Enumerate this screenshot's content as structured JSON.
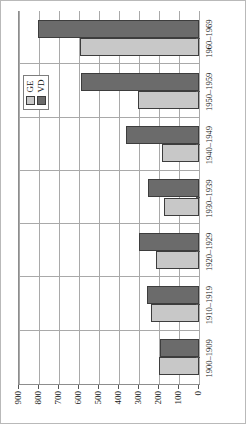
{
  "chart_data": {
    "type": "bar",
    "orientation": "horizontal",
    "title": "",
    "subtitle": "",
    "xlabel": "",
    "ylabel": "",
    "grid": true,
    "legend_position": "top-right-inside",
    "categories": [
      "1900–1909",
      "1910–1919",
      "1920–1929",
      "1930–1939",
      "1940–1949",
      "1950–1959",
      "1960–1969"
    ],
    "value_axis": {
      "min": 0,
      "max": 900,
      "ticks": [
        0,
        100,
        200,
        300,
        400,
        500,
        600,
        700,
        800,
        900
      ],
      "tick_labels": [
        "0",
        "100",
        "200",
        "300",
        "400",
        "500",
        "600",
        "700",
        "800",
        "900"
      ],
      "direction": "right-to-left"
    },
    "ylim": [
      0,
      900
    ],
    "series": [
      {
        "name": "GE",
        "color": "#c8c8c8",
        "values": [
          200,
          240,
          215,
          175,
          185,
          305,
          595
        ]
      },
      {
        "name": "VD",
        "color": "#6b6b6b",
        "values": [
          195,
          260,
          300,
          255,
          365,
          590,
          805
        ]
      }
    ]
  },
  "legend": {
    "items": [
      {
        "label": "GE",
        "swatch": "light-gray-square"
      },
      {
        "label": "VD",
        "swatch": "dark-gray-square"
      }
    ]
  },
  "colors": {
    "series_ge": "#c8c8c8",
    "series_vd": "#6b6b6b",
    "bar_outline": "#3d3d3d",
    "gridline": "#a9a9a9",
    "axis": "#8d8d8d",
    "page_border": "#b9b9b9",
    "text": "#1a1a1a"
  }
}
